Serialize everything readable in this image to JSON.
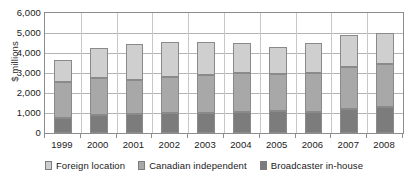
{
  "chart_data": {
    "type": "bar",
    "stacked": true,
    "title": "",
    "subtitle": "",
    "xlabel": "",
    "ylabel": "$ millions",
    "ylim": [
      0,
      6000
    ],
    "ytick_interval": 1000,
    "ytick_labels": [
      "6,000",
      "5,000",
      "4,000",
      "3,000",
      "2,000",
      "1,000",
      "0"
    ],
    "ytick_values": [
      6000,
      5000,
      4000,
      3000,
      2000,
      1000,
      0
    ],
    "grid": true,
    "grid_axis": "y",
    "legend_position": "bottom",
    "categories": [
      "1999",
      "2000",
      "2001",
      "2002",
      "2003",
      "2004",
      "2005",
      "2006",
      "2007",
      "2008"
    ],
    "series": [
      {
        "name": "Broadcaster in-house",
        "color": "#7c7c7c",
        "values": [
          750,
          880,
          950,
          980,
          1000,
          1050,
          1080,
          1050,
          1200,
          1300
        ]
      },
      {
        "name": "Canadian independent",
        "color": "#a8a8a8",
        "values": [
          1800,
          1850,
          1700,
          1800,
          1900,
          1950,
          1870,
          1950,
          2100,
          2150
        ]
      },
      {
        "name": "Foreign location",
        "color": "#cfcfcf",
        "values": [
          1100,
          1520,
          1800,
          1770,
          1650,
          1500,
          1350,
          1500,
          1600,
          1550
        ]
      }
    ],
    "totals": [
      3650,
      4250,
      4450,
      4550,
      4550,
      4500,
      4300,
      4500,
      4900,
      5000
    ],
    "stack_order_bottom_to_top": [
      "Broadcaster in-house",
      "Canadian independent",
      "Foreign location"
    ]
  },
  "legend": {
    "items": [
      {
        "label": "Foreign location",
        "color": "#cfcfcf",
        "swatch_name": "legend-swatch-foreign-location"
      },
      {
        "label": "Canadian independent",
        "color": "#a8a8a8",
        "swatch_name": "legend-swatch-canadian-independent"
      },
      {
        "label": "Broadcaster in-house",
        "color": "#7c7c7c",
        "swatch_name": "legend-swatch-broadcaster-in-house"
      }
    ]
  },
  "axes": {
    "y_title": "$ millions"
  }
}
